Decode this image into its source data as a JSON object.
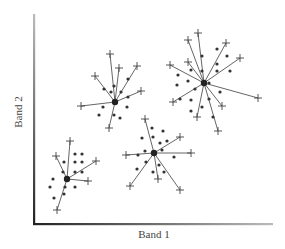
{
  "chart_data": {
    "type": "scatter",
    "title": "",
    "xlabel": "Band 1",
    "ylabel": "Band 2",
    "grid": false,
    "legend": null,
    "axes": {
      "origin": [
        34,
        224
      ],
      "x_end": 272,
      "y_end": 14
    },
    "clusters": [
      {
        "name": "cluster-a",
        "centroid": [
          115,
          102
        ],
        "crosses": [
          [
            110,
            54
          ],
          [
            119,
            68
          ],
          [
            137,
            66
          ],
          [
            95,
            76
          ],
          [
            141,
            91
          ],
          [
            81,
            106
          ],
          [
            109,
            128
          ]
        ],
        "dots": [
          [
            104,
            89
          ],
          [
            111,
            92
          ],
          [
            114,
            86
          ],
          [
            121,
            92
          ],
          [
            128,
            79
          ],
          [
            103,
            107
          ],
          [
            99,
            115
          ],
          [
            114,
            115
          ],
          [
            120,
            118
          ],
          [
            128,
            97
          ],
          [
            127,
            107
          ]
        ]
      },
      {
        "name": "cluster-b",
        "centroid": [
          204,
          83
        ],
        "crosses": [
          [
            198,
            33
          ],
          [
            188,
            40
          ],
          [
            226,
            43
          ],
          [
            240,
            58
          ],
          [
            170,
            65
          ],
          [
            188,
            62
          ],
          [
            258,
            98
          ],
          [
            173,
            102
          ],
          [
            197,
            117
          ],
          [
            222,
            106
          ],
          [
            218,
            131
          ]
        ],
        "dots": [
          [
            217,
            49
          ],
          [
            227,
            56
          ],
          [
            202,
            56
          ],
          [
            217,
            64
          ],
          [
            230,
            71
          ],
          [
            178,
            75
          ],
          [
            191,
            70
          ],
          [
            202,
            71
          ],
          [
            217,
            71
          ],
          [
            177,
            85
          ],
          [
            188,
            81
          ],
          [
            195,
            89
          ],
          [
            180,
            99
          ],
          [
            191,
            100
          ],
          [
            202,
            107
          ],
          [
            191,
            111
          ],
          [
            209,
            99
          ],
          [
            220,
            92
          ],
          [
            213,
            117
          ],
          [
            209,
            83
          ]
        ]
      },
      {
        "name": "cluster-c",
        "centroid": [
          154,
          153
        ],
        "crosses": [
          [
            145,
            119
          ],
          [
            180,
            137
          ],
          [
            126,
            155
          ],
          [
            191,
            153
          ],
          [
            130,
            186
          ],
          [
            158,
            179
          ],
          [
            180,
            190
          ]
        ],
        "dots": [
          [
            152,
            128
          ],
          [
            163,
            131
          ],
          [
            142,
            138
          ],
          [
            153,
            137
          ],
          [
            160,
            143
          ],
          [
            167,
            141
          ],
          [
            145,
            151
          ],
          [
            138,
            155
          ],
          [
            162,
            150
          ],
          [
            174,
            157
          ],
          [
            146,
            162
          ],
          [
            137,
            169
          ],
          [
            153,
            172
          ],
          [
            164,
            172
          ],
          [
            159,
            165
          ]
        ]
      },
      {
        "name": "cluster-d",
        "centroid": [
          67,
          179
        ],
        "crosses": [
          [
            70,
            141
          ],
          [
            56,
            156
          ],
          [
            96,
            161
          ],
          [
            88,
            181
          ],
          [
            57,
            210
          ]
        ],
        "dots": [
          [
            75,
            154
          ],
          [
            82,
            154
          ],
          [
            64,
            162
          ],
          [
            75,
            162
          ],
          [
            82,
            162
          ],
          [
            63,
            172
          ],
          [
            75,
            172
          ],
          [
            82,
            172
          ],
          [
            53,
            179
          ],
          [
            50,
            187
          ],
          [
            65,
            187
          ],
          [
            75,
            187
          ],
          [
            64,
            194
          ],
          [
            54,
            198
          ]
        ]
      }
    ]
  },
  "labels": {
    "x_axis": "Band 1",
    "y_axis": "Band 2"
  }
}
